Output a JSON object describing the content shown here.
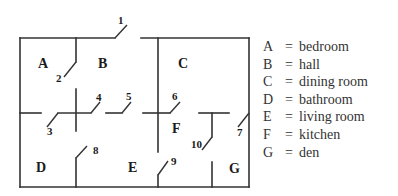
{
  "floor_plan": {
    "rooms": [
      {
        "key": "A",
        "x": 38,
        "y": 68
      },
      {
        "key": "B",
        "x": 98,
        "y": 68
      },
      {
        "key": "C",
        "x": 178,
        "y": 68
      },
      {
        "key": "D",
        "x": 36,
        "y": 172
      },
      {
        "key": "E",
        "x": 128,
        "y": 172
      },
      {
        "key": "F",
        "x": 172,
        "y": 133
      },
      {
        "key": "G",
        "x": 229,
        "y": 173
      }
    ],
    "doors": [
      {
        "number": "1",
        "x": 118,
        "y": 24
      },
      {
        "number": "2",
        "x": 56,
        "y": 82
      },
      {
        "number": "3",
        "x": 47,
        "y": 135
      },
      {
        "number": "4",
        "x": 96,
        "y": 101
      },
      {
        "number": "5",
        "x": 126,
        "y": 100
      },
      {
        "number": "6",
        "x": 172,
        "y": 100
      },
      {
        "number": "7",
        "x": 237,
        "y": 136
      },
      {
        "number": "8",
        "x": 93,
        "y": 154
      },
      {
        "number": "9",
        "x": 171,
        "y": 165
      },
      {
        "number": "10",
        "x": 191,
        "y": 148
      }
    ]
  },
  "legend": [
    {
      "key": "A",
      "eq": "=",
      "room": "bedroom"
    },
    {
      "key": "B",
      "eq": "=",
      "room": "hall"
    },
    {
      "key": "C",
      "eq": "=",
      "room": "dining room"
    },
    {
      "key": "D",
      "eq": "=",
      "room": "bathroom"
    },
    {
      "key": "E",
      "eq": "=",
      "room": "living room"
    },
    {
      "key": "F",
      "eq": "=",
      "room": "kitchen"
    },
    {
      "key": "G",
      "eq": "=",
      "room": "den"
    }
  ]
}
